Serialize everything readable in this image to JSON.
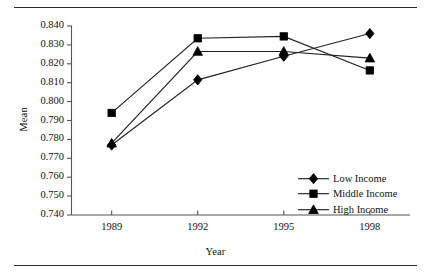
{
  "figure": {
    "top_rule": true,
    "bottom_rule": true,
    "clipped_caption_fragment": ""
  },
  "chart_data": {
    "type": "line",
    "title": "",
    "xlabel": "Year",
    "ylabel": "Mean",
    "categories": [
      "1989",
      "1992",
      "1995",
      "1998"
    ],
    "x": [
      1989,
      1992,
      1995,
      1998
    ],
    "xlim": [
      1987.6,
      1999.4
    ],
    "ylim": [
      0.74,
      0.84
    ],
    "ytick_labels": [
      "0.840",
      "0.830",
      "0.820",
      "0.810",
      "0.800",
      "0.790",
      "0.780",
      "0.770",
      "0.760",
      "0.750",
      "0.740"
    ],
    "ytick_values": [
      0.84,
      0.83,
      0.82,
      0.81,
      0.8,
      0.79,
      0.78,
      0.77,
      0.76,
      0.75,
      0.74
    ],
    "ytick_step": 0.01,
    "grid": false,
    "legend_position": "lower right",
    "line_color": "#222222",
    "marker_color": "#000000",
    "series": [
      {
        "name": "Low Income",
        "marker": "diamond",
        "values": [
          0.777,
          0.8115,
          0.824,
          0.836
        ]
      },
      {
        "name": "Middle Income",
        "marker": "square",
        "values": [
          0.794,
          0.8335,
          0.8345,
          0.8165
        ]
      },
      {
        "name": "High Income",
        "marker": "triangle",
        "values": [
          0.778,
          0.8265,
          0.8265,
          0.823
        ]
      }
    ]
  }
}
